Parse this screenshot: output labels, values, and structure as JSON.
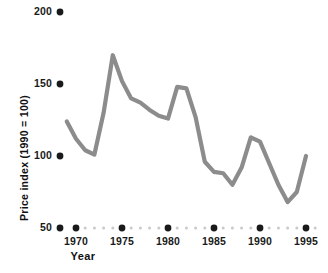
{
  "chart_data": {
    "type": "line",
    "title": "",
    "xlabel": "Year",
    "ylabel": "Price index (1990 = 100)",
    "xlim": [
      1969,
      1996
    ],
    "ylim": [
      50,
      200
    ],
    "grid": false,
    "legend": "none",
    "line_color": "#8c8c8c",
    "dot_color": "#1a1a1a",
    "minor_dot_color": "#c9c9c9",
    "y_ticks": [
      50,
      100,
      150,
      200
    ],
    "y_tick_labels": [
      "50",
      "100",
      "150",
      "200"
    ],
    "x_ticks": [
      1970,
      1975,
      1980,
      1985,
      1990,
      1995
    ],
    "x_tick_labels": [
      "1970",
      "1975",
      "1980",
      "1985",
      "1990",
      "1995"
    ],
    "x_minor_ticks": [
      1971,
      1972,
      1973,
      1974,
      1976,
      1977,
      1978,
      1979,
      1981,
      1982,
      1983,
      1984,
      1986,
      1987,
      1988,
      1989,
      1991,
      1992,
      1993,
      1994,
      1996
    ],
    "x": [
      1969,
      1970,
      1971,
      1972,
      1973,
      1974,
      1975,
      1976,
      1977,
      1978,
      1979,
      1980,
      1981,
      1982,
      1983,
      1984,
      1985,
      1986,
      1987,
      1988,
      1989,
      1990,
      1991,
      1992,
      1993,
      1994,
      1995
    ],
    "values": [
      124,
      112,
      104,
      101,
      130,
      170,
      152,
      140,
      137,
      132,
      128,
      126,
      148,
      147,
      127,
      96,
      89,
      88,
      80,
      92,
      113,
      110,
      95,
      80,
      68,
      75,
      100
    ],
    "series": [
      {
        "name": "Price index",
        "values": [
          124,
          112,
          104,
          101,
          130,
          170,
          152,
          140,
          137,
          132,
          128,
          126,
          148,
          147,
          127,
          96,
          89,
          88,
          80,
          92,
          113,
          110,
          95,
          80,
          68,
          75,
          100
        ]
      }
    ]
  }
}
